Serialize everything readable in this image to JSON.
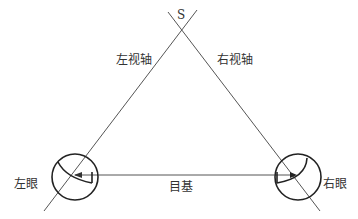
{
  "diagram": {
    "labels": {
      "apex": "S",
      "left_axis": "左视轴",
      "right_axis": "右视轴",
      "left_eye": "左眼",
      "right_eye": "右眼",
      "baseline": "目基"
    },
    "colors": {
      "line": "#333333",
      "thin_line": "#555555"
    }
  }
}
